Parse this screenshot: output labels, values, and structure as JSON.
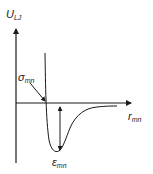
{
  "diagram": {
    "y_axis_label": {
      "main": "U",
      "sub": "LJ"
    },
    "x_axis_label": {
      "main": "r",
      "sub": "mn"
    },
    "sigma_label": {
      "main": "σ",
      "sub": "mn"
    },
    "epsilon_label": {
      "main": "ε",
      "sub": "mn"
    },
    "colors": {
      "line": "#1a1a1a",
      "background": "#ffffff"
    }
  }
}
